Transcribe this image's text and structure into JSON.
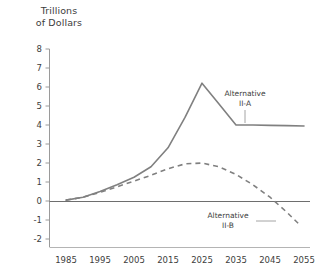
{
  "chart_data": {
    "type": "line",
    "title": "",
    "ylabel": "Trillions\nof Dollars",
    "ylabel_line1": "Trillions",
    "ylabel_line2": "of Dollars",
    "xlabel": "",
    "x": [
      1985,
      1995,
      2005,
      2015,
      2025,
      2035,
      2045,
      2055
    ],
    "xlim": [
      1983,
      2057
    ],
    "ylim": [
      -2,
      8
    ],
    "yticks": [
      8,
      7,
      6,
      5,
      4,
      3,
      2,
      1,
      0,
      -1,
      -2
    ],
    "ytick_labels": [
      "8",
      "7",
      "6",
      "5",
      "4",
      "3",
      "2",
      "1",
      "0",
      "-1",
      "-2"
    ],
    "xtick_labels": [
      "1985",
      "1995",
      "2005",
      "2015",
      "2025",
      "2035",
      "2045",
      "2055"
    ],
    "grid": false,
    "zero_line": true,
    "legend": "annotations",
    "series": [
      {
        "name": "Alternative II-A",
        "style": "solid",
        "color": "#808080",
        "x": [
          1985,
          1990,
          1995,
          2000,
          2005,
          2010,
          2015,
          2020,
          2025,
          2030,
          2035,
          2040,
          2045,
          2050,
          2055
        ],
        "values": [
          0.05,
          0.2,
          0.5,
          0.85,
          1.25,
          1.8,
          2.8,
          4.4,
          6.2,
          5.1,
          4.0,
          4.0,
          3.98,
          3.97,
          3.95
        ]
      },
      {
        "name": "Alternative II-B",
        "style": "dashed",
        "color": "#808080",
        "x": [
          1985,
          1990,
          1995,
          2000,
          2005,
          2010,
          2015,
          2020,
          2025,
          2030,
          2035,
          2040,
          2045,
          2050,
          2054
        ],
        "values": [
          0.05,
          0.2,
          0.45,
          0.75,
          1.05,
          1.35,
          1.7,
          1.95,
          2.0,
          1.8,
          1.4,
          0.85,
          0.2,
          -0.6,
          -1.3
        ]
      }
    ],
    "annotations": [
      {
        "label_line1": "Alternative",
        "label_line2": "II-A",
        "target_series": "Alternative II-A",
        "leader": "vertical"
      },
      {
        "label_line1": "Alternative",
        "label_line2": "II-B",
        "target_series": "Alternative II-B",
        "leader": "horizontal"
      }
    ],
    "colors": {
      "line": "#808080",
      "axis": "#9a9a9a",
      "text": "#3d3d3d",
      "background": "#ffffff"
    }
  }
}
